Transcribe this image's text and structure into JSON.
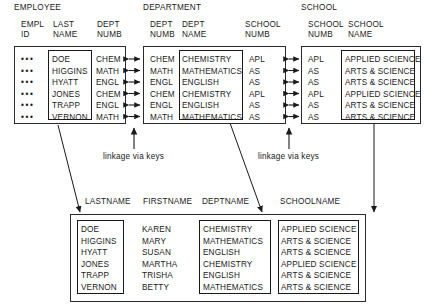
{
  "diagram": {
    "title_note": "Relational tables linked via keys",
    "link_labels": [
      "linkage via keys",
      "linkage via keys"
    ]
  },
  "tables": {
    "employee": {
      "title": "EMPLOYEE",
      "columns": [
        {
          "name": "empl-id",
          "line1": "EMPL",
          "line2": "ID"
        },
        {
          "name": "last-name",
          "line1": "LAST",
          "line2": "NAME"
        },
        {
          "name": "dept-numb",
          "line1": "DEPT",
          "line2": "NUMB"
        }
      ],
      "rows": [
        {
          "empl_id": "•••",
          "last_name": "DOE",
          "dept_numb": "CHEM"
        },
        {
          "empl_id": "•••",
          "last_name": "HIGGINS",
          "dept_numb": "MATH"
        },
        {
          "empl_id": "•••",
          "last_name": "HYATT",
          "dept_numb": "ENGL"
        },
        {
          "empl_id": "•••",
          "last_name": "JONES",
          "dept_numb": "CHEM"
        },
        {
          "empl_id": "•••",
          "last_name": "TRAPP",
          "dept_numb": "ENGL"
        },
        {
          "empl_id": "•••",
          "last_name": "VERNON",
          "dept_numb": "MATH"
        }
      ]
    },
    "department": {
      "title": "DEPARTMENT",
      "columns": [
        {
          "name": "dept-numb",
          "line1": "DEPT",
          "line2": "NUMB"
        },
        {
          "name": "dept-name",
          "line1": "DEPT",
          "line2": "NAME"
        },
        {
          "name": "school-numb",
          "line1": "SCHOOL",
          "line2": "NUMB"
        }
      ],
      "rows": [
        {
          "dept_numb": "CHEM",
          "dept_name": "CHEMISTRY",
          "school_numb": "APL"
        },
        {
          "dept_numb": "MATH",
          "dept_name": "MATHEMATICS",
          "school_numb": "AS"
        },
        {
          "dept_numb": "ENGL",
          "dept_name": "ENGLISH",
          "school_numb": "AS"
        },
        {
          "dept_numb": "CHEM",
          "dept_name": "CHEMISTRY",
          "school_numb": "APL"
        },
        {
          "dept_numb": "ENGL",
          "dept_name": "ENGLISH",
          "school_numb": "AS"
        },
        {
          "dept_numb": "MATH",
          "dept_name": "MATHEMATICS",
          "school_numb": "AS"
        }
      ]
    },
    "school": {
      "title": "SCHOOL",
      "columns": [
        {
          "name": "school-numb",
          "line1": "SCHOOL",
          "line2": "NUMB"
        },
        {
          "name": "school-name",
          "line1": "SCHOOL",
          "line2": "NAME"
        }
      ],
      "rows": [
        {
          "school_numb": "APL",
          "school_name": "APPLIED SCIENCE"
        },
        {
          "school_numb": "AS",
          "school_name": "ARTS & SCIENCE"
        },
        {
          "school_numb": "AS",
          "school_name": "ARTS & SCIENCE"
        },
        {
          "school_numb": "APL",
          "school_name": "APPLIED SCIENCE"
        },
        {
          "school_numb": "AS",
          "school_name": "ARTS & SCIENCE"
        },
        {
          "school_numb": "AS",
          "school_name": "ARTS & SCIENCE"
        }
      ]
    },
    "result": {
      "columns": [
        {
          "name": "lastname",
          "label": "LASTNAME"
        },
        {
          "name": "firstname",
          "label": "FIRSTNAME"
        },
        {
          "name": "deptname",
          "label": "DEPTNAME"
        },
        {
          "name": "schoolname",
          "label": "SCHOOLNAME"
        }
      ],
      "rows": [
        {
          "lastname": "DOE",
          "firstname": "KAREN",
          "deptname": "CHEMISTRY",
          "schoolname": "APPLIED SCIENCE"
        },
        {
          "lastname": "HIGGINS",
          "firstname": "MARY",
          "deptname": "MATHEMATICS",
          "schoolname": "ARTS & SCIENCE"
        },
        {
          "lastname": "HYATT",
          "firstname": "SUSAN",
          "deptname": "ENGLISH",
          "schoolname": "ARTS & SCIENCE"
        },
        {
          "lastname": "JONES",
          "firstname": "MARTHA",
          "deptname": "CHEMISTRY",
          "schoolname": "APPLIED SCIENCE"
        },
        {
          "lastname": "TRAPP",
          "firstname": "TRISHA",
          "deptname": "ENGLISH",
          "schoolname": "ARTS & SCIENCE"
        },
        {
          "lastname": "VERNON",
          "firstname": "BETTY",
          "deptname": "MATHEMATICS",
          "schoolname": "ARTS & SCIENCE"
        }
      ]
    }
  },
  "colors": {
    "ink": "#1a1a1a",
    "line": "#2a2a2a",
    "background": "#ffffff"
  }
}
